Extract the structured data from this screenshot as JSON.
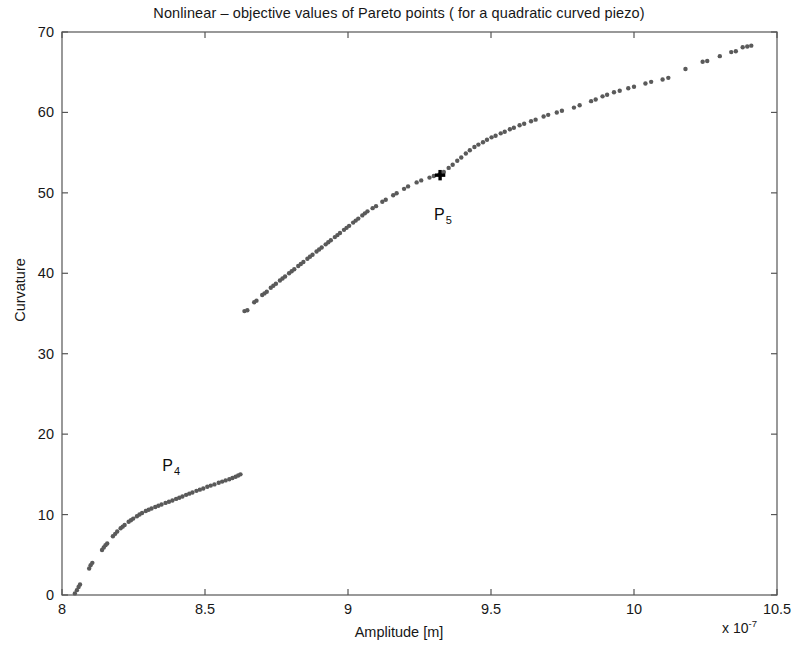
{
  "chart_data": {
    "type": "scatter",
    "title": "Nonlinear – objective values of Pareto points ( for a quadratic curved piezo)",
    "xlabel": "Amplitude [m]",
    "ylabel": "Curvature",
    "x_exponent_prefix": "x 10",
    "x_exponent_power": "-7",
    "xlim": [
      8,
      10.5
    ],
    "ylim": [
      0,
      70
    ],
    "xticks": [
      8,
      8.5,
      9,
      9.5,
      10,
      10.5
    ],
    "xtick_labels": [
      "8",
      "8.5",
      "9",
      "9.5",
      "10",
      "10.5"
    ],
    "yticks": [
      0,
      10,
      20,
      30,
      40,
      50,
      60,
      70
    ],
    "ytick_labels": [
      "0",
      "10",
      "20",
      "30",
      "40",
      "50",
      "60",
      "70"
    ],
    "grid": false,
    "legend": null,
    "marker": "dot",
    "marker_color": "#5a5a5a",
    "marker_size": 2.2,
    "series": [
      {
        "name": "lower-pareto-branch",
        "points": [
          [
            8.045,
            0.2
          ],
          [
            8.052,
            0.6
          ],
          [
            8.058,
            1.0
          ],
          [
            8.063,
            1.3
          ],
          [
            8.095,
            3.3
          ],
          [
            8.1,
            3.7
          ],
          [
            8.106,
            4.0
          ],
          [
            8.14,
            5.6
          ],
          [
            8.146,
            5.9
          ],
          [
            8.152,
            6.2
          ],
          [
            8.158,
            6.4
          ],
          [
            8.178,
            7.3
          ],
          [
            8.186,
            7.6
          ],
          [
            8.193,
            7.9
          ],
          [
            8.205,
            8.3
          ],
          [
            8.212,
            8.5
          ],
          [
            8.219,
            8.7
          ],
          [
            8.233,
            9.1
          ],
          [
            8.241,
            9.3
          ],
          [
            8.249,
            9.5
          ],
          [
            8.262,
            9.8
          ],
          [
            8.271,
            10.0
          ],
          [
            8.28,
            10.2
          ],
          [
            8.293,
            10.45
          ],
          [
            8.303,
            10.6
          ],
          [
            8.313,
            10.75
          ],
          [
            8.326,
            10.95
          ],
          [
            8.337,
            11.1
          ],
          [
            8.348,
            11.25
          ],
          [
            8.362,
            11.45
          ],
          [
            8.374,
            11.6
          ],
          [
            8.386,
            11.75
          ],
          [
            8.399,
            11.95
          ],
          [
            8.41,
            12.1
          ],
          [
            8.421,
            12.25
          ],
          [
            8.434,
            12.45
          ],
          [
            8.445,
            12.6
          ],
          [
            8.456,
            12.75
          ],
          [
            8.47,
            12.95
          ],
          [
            8.482,
            13.1
          ],
          [
            8.494,
            13.25
          ],
          [
            8.508,
            13.45
          ],
          [
            8.52,
            13.6
          ],
          [
            8.533,
            13.75
          ],
          [
            8.548,
            13.95
          ],
          [
            8.56,
            14.1
          ],
          [
            8.572,
            14.25
          ],
          [
            8.585,
            14.4
          ],
          [
            8.596,
            14.55
          ],
          [
            8.607,
            14.7
          ],
          [
            8.616,
            14.85
          ],
          [
            8.624,
            15.0
          ]
        ]
      },
      {
        "name": "upper-pareto-branch",
        "points": [
          [
            8.638,
            35.3
          ],
          [
            8.648,
            35.4
          ],
          [
            8.672,
            36.4
          ],
          [
            8.68,
            36.6
          ],
          [
            8.7,
            37.3
          ],
          [
            8.708,
            37.5
          ],
          [
            8.716,
            37.7
          ],
          [
            8.73,
            38.2
          ],
          [
            8.739,
            38.45
          ],
          [
            8.748,
            38.7
          ],
          [
            8.762,
            39.1
          ],
          [
            8.771,
            39.35
          ],
          [
            8.78,
            39.6
          ],
          [
            8.794,
            40.0
          ],
          [
            8.803,
            40.25
          ],
          [
            8.812,
            40.5
          ],
          [
            8.826,
            40.9
          ],
          [
            8.835,
            41.15
          ],
          [
            8.844,
            41.4
          ],
          [
            8.858,
            41.8
          ],
          [
            8.867,
            42.05
          ],
          [
            8.876,
            42.3
          ],
          [
            8.89,
            42.7
          ],
          [
            8.899,
            42.95
          ],
          [
            8.908,
            43.2
          ],
          [
            8.922,
            43.6
          ],
          [
            8.931,
            43.85
          ],
          [
            8.94,
            44.1
          ],
          [
            8.954,
            44.5
          ],
          [
            8.963,
            44.75
          ],
          [
            8.972,
            45.0
          ],
          [
            8.986,
            45.4
          ],
          [
            8.995,
            45.65
          ],
          [
            9.004,
            45.9
          ],
          [
            9.018,
            46.3
          ],
          [
            9.027,
            46.55
          ],
          [
            9.036,
            46.8
          ],
          [
            9.05,
            47.2
          ],
          [
            9.059,
            47.45
          ],
          [
            9.068,
            47.7
          ],
          [
            9.086,
            48.1
          ],
          [
            9.098,
            48.35
          ],
          [
            9.12,
            48.9
          ],
          [
            9.132,
            49.15
          ],
          [
            9.158,
            49.7
          ],
          [
            9.17,
            49.95
          ],
          [
            9.196,
            50.5
          ],
          [
            9.21,
            50.8
          ],
          [
            9.24,
            51.3
          ],
          [
            9.256,
            51.55
          ],
          [
            9.285,
            51.9
          ],
          [
            9.3,
            52.1
          ],
          [
            9.32,
            52.3
          ],
          [
            9.335,
            52.6
          ],
          [
            9.352,
            53.1
          ],
          [
            9.366,
            53.5
          ],
          [
            9.382,
            54.0
          ],
          [
            9.396,
            54.4
          ],
          [
            9.412,
            54.9
          ],
          [
            9.426,
            55.3
          ],
          [
            9.442,
            55.7
          ],
          [
            9.456,
            56.0
          ],
          [
            9.472,
            56.3
          ],
          [
            9.486,
            56.6
          ],
          [
            9.502,
            56.9
          ],
          [
            9.516,
            57.1
          ],
          [
            9.534,
            57.4
          ],
          [
            9.548,
            57.6
          ],
          [
            9.566,
            57.9
          ],
          [
            9.58,
            58.1
          ],
          [
            9.6,
            58.4
          ],
          [
            9.616,
            58.6
          ],
          [
            9.64,
            58.9
          ],
          [
            9.656,
            59.1
          ],
          [
            9.684,
            59.5
          ],
          [
            9.7,
            59.7
          ],
          [
            9.73,
            60.0
          ],
          [
            9.748,
            60.2
          ],
          [
            9.79,
            60.6
          ],
          [
            9.81,
            60.9
          ],
          [
            9.85,
            61.4
          ],
          [
            9.866,
            61.6
          ],
          [
            9.89,
            62.0
          ],
          [
            9.906,
            62.2
          ],
          [
            9.93,
            62.5
          ],
          [
            9.95,
            62.7
          ],
          [
            9.98,
            63.0
          ],
          [
            10.0,
            63.2
          ],
          [
            10.04,
            63.6
          ],
          [
            10.06,
            63.8
          ],
          [
            10.1,
            64.1
          ],
          [
            10.12,
            64.3
          ],
          [
            10.18,
            65.4
          ],
          [
            10.24,
            66.3
          ],
          [
            10.256,
            66.4
          ],
          [
            10.3,
            67.0
          ],
          [
            10.34,
            67.5
          ],
          [
            10.356,
            67.6
          ],
          [
            10.38,
            68.1
          ],
          [
            10.396,
            68.2
          ],
          [
            10.41,
            68.3
          ]
        ]
      }
    ],
    "annotations": [
      {
        "name": "P4",
        "label": "P",
        "subscript": "4",
        "label_x": 8.38,
        "label_y": 17.2,
        "has_marker": false
      },
      {
        "name": "P5",
        "label": "P",
        "subscript": "5",
        "label_x": 9.33,
        "label_y": 48.4,
        "has_marker": true,
        "marker_x": 9.322,
        "marker_y": 52.2,
        "marker_symbol": "+"
      }
    ],
    "axis_color": "#555555",
    "text_color": "#171717",
    "background": "#ffffff"
  }
}
